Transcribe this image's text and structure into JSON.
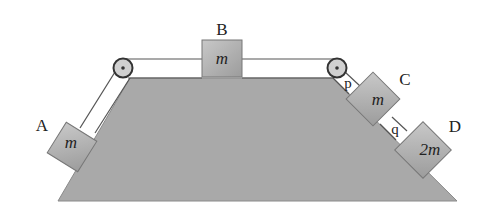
{
  "diagram": {
    "colors": {
      "surface": "#a9a9a9",
      "block": "#b5b5b5",
      "string": "#555555",
      "pulley": "#cfcfcf",
      "text": "#222222"
    },
    "blocks": [
      {
        "id": "A",
        "label": "A",
        "mass": "m"
      },
      {
        "id": "B",
        "label": "B",
        "mass": "m"
      },
      {
        "id": "C",
        "label": "C",
        "mass": "m"
      },
      {
        "id": "D",
        "label": "D",
        "mass": "2m"
      }
    ],
    "strings": [
      {
        "id": "p",
        "label": "p"
      },
      {
        "id": "q",
        "label": "q"
      }
    ]
  }
}
